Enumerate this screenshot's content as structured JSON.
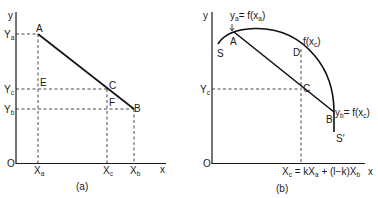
{
  "panel_a": {
    "caption": "(a)",
    "axis": {
      "x": "x",
      "y": "y",
      "origin": "O"
    },
    "y_ticks": [
      {
        "main": "Y",
        "sub": "a"
      },
      {
        "main": "Y",
        "sub": "c"
      },
      {
        "main": "Y",
        "sub": "b"
      }
    ],
    "x_ticks": [
      {
        "main": "X",
        "sub": "a"
      },
      {
        "main": "X",
        "sub": "c"
      },
      {
        "main": "X",
        "sub": "b"
      }
    ],
    "points": {
      "A": "A",
      "B": "B",
      "C": "C",
      "E": "E",
      "F": "F"
    }
  },
  "panel_b": {
    "caption": "(b)",
    "axis": {
      "x": "x",
      "y": "y",
      "origin": "O"
    },
    "y_tick": {
      "main": "Y",
      "sub": "c"
    },
    "x_formula": {
      "p1": "X",
      "s1": "c",
      "p2": " = kX",
      "s2": "a",
      "p3": " + (l−k)X",
      "s3": "b"
    },
    "points": {
      "A": "A",
      "B": "B",
      "C": "C",
      "D": "D",
      "S": "S",
      "S_prime": "S′"
    },
    "annotations": {
      "ya": {
        "p1": "y",
        "s1": "a",
        "p2": "= f(x",
        "s2": "a",
        "p3": ")"
      },
      "fxc": {
        "p1": "f(x",
        "s1": "c",
        "p2": ")"
      },
      "yb": {
        "p1": "y",
        "s1": "b",
        "p2": "= f(x",
        "s2": "c",
        "p3": ")"
      }
    }
  }
}
